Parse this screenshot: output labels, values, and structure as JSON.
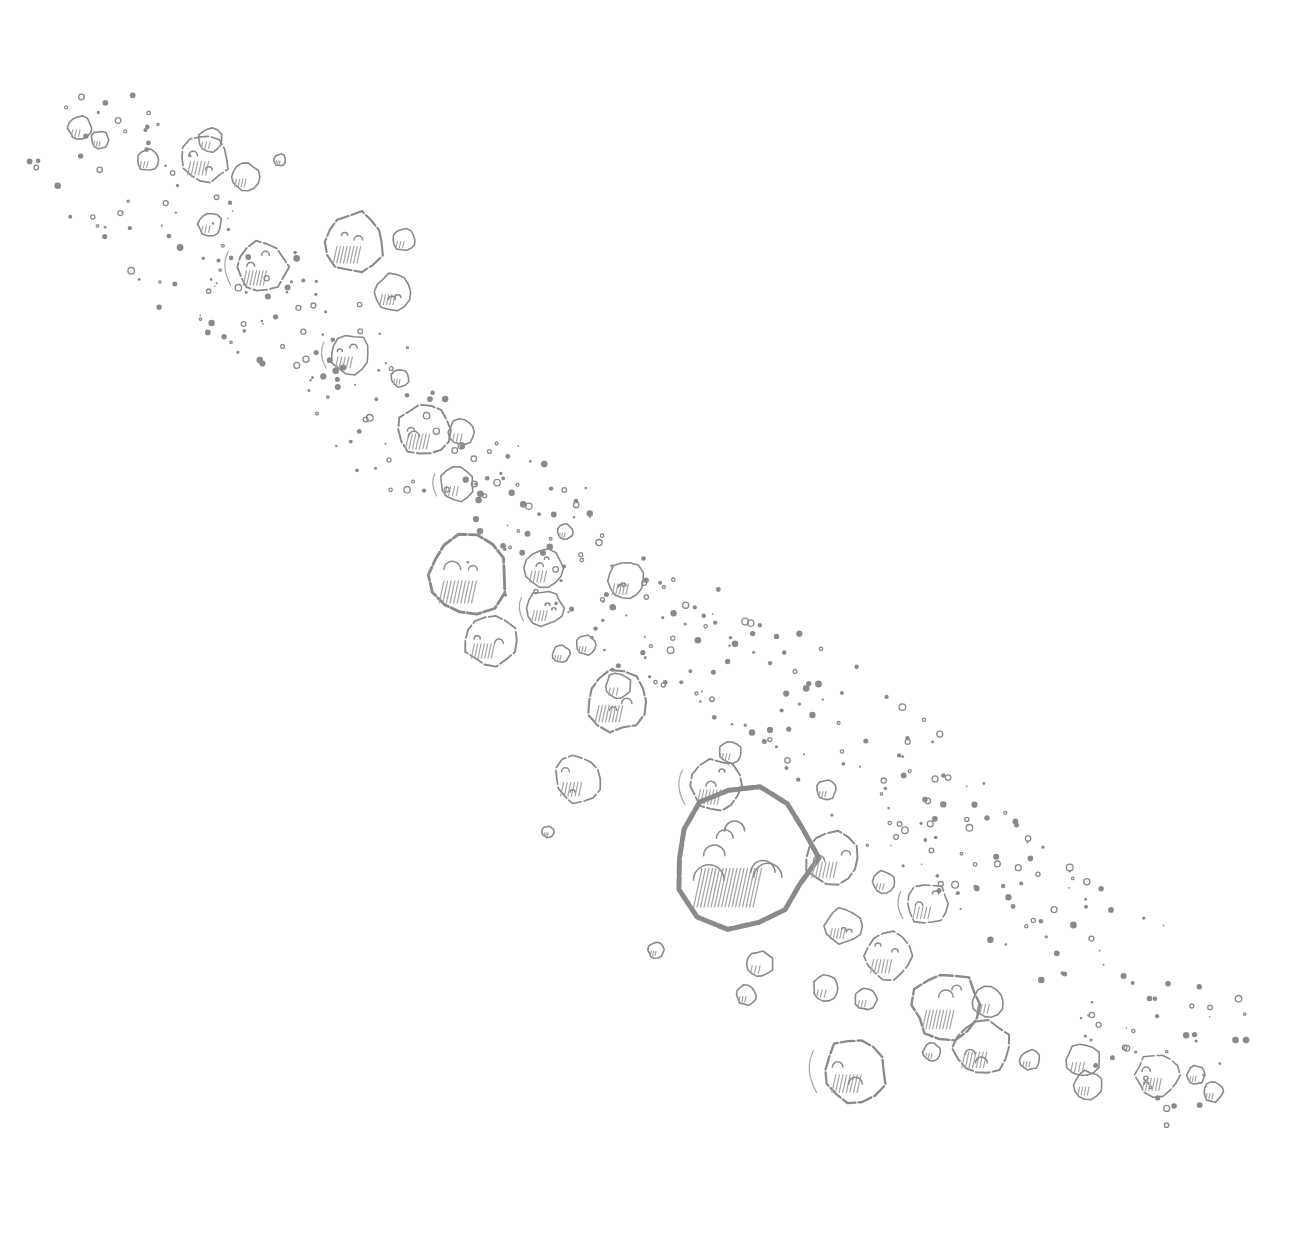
{
  "illustration": {
    "subject": "Pencil sketch of an asteroid belt",
    "background": "#ffffff",
    "ink": "#8a8a8a",
    "ink_light": "#a6a6a6",
    "width": 1298,
    "height": 1251,
    "asteroids": [
      {
        "x": 80,
        "y": 128,
        "r": 12
      },
      {
        "x": 100,
        "y": 140,
        "r": 9
      },
      {
        "x": 148,
        "y": 160,
        "r": 11
      },
      {
        "x": 205,
        "y": 158,
        "r": 24
      },
      {
        "x": 210,
        "y": 140,
        "r": 12
      },
      {
        "x": 245,
        "y": 177,
        "r": 14
      },
      {
        "x": 280,
        "y": 160,
        "r": 6
      },
      {
        "x": 210,
        "y": 224,
        "r": 12
      },
      {
        "x": 262,
        "y": 267,
        "r": 26
      },
      {
        "x": 355,
        "y": 242,
        "r": 30
      },
      {
        "x": 404,
        "y": 240,
        "r": 11
      },
      {
        "x": 393,
        "y": 292,
        "r": 18
      },
      {
        "x": 350,
        "y": 354,
        "r": 20
      },
      {
        "x": 400,
        "y": 378,
        "r": 9
      },
      {
        "x": 425,
        "y": 430,
        "r": 27
      },
      {
        "x": 462,
        "y": 432,
        "r": 13
      },
      {
        "x": 457,
        "y": 484,
        "r": 17
      },
      {
        "x": 468,
        "y": 575,
        "r": 40
      },
      {
        "x": 490,
        "y": 640,
        "r": 26
      },
      {
        "x": 544,
        "y": 568,
        "r": 20
      },
      {
        "x": 545,
        "y": 608,
        "r": 18
      },
      {
        "x": 565,
        "y": 532,
        "r": 8
      },
      {
        "x": 626,
        "y": 581,
        "r": 19
      },
      {
        "x": 586,
        "y": 645,
        "r": 10
      },
      {
        "x": 561,
        "y": 654,
        "r": 9
      },
      {
        "x": 617,
        "y": 701,
        "r": 30
      },
      {
        "x": 618,
        "y": 686,
        "r": 13
      },
      {
        "x": 578,
        "y": 779,
        "r": 24
      },
      {
        "x": 716,
        "y": 786,
        "r": 26
      },
      {
        "x": 730,
        "y": 752,
        "r": 11
      },
      {
        "x": 744,
        "y": 858,
        "r": 70
      },
      {
        "x": 832,
        "y": 858,
        "r": 28
      },
      {
        "x": 826,
        "y": 790,
        "r": 10
      },
      {
        "x": 884,
        "y": 882,
        "r": 11
      },
      {
        "x": 843,
        "y": 926,
        "r": 18
      },
      {
        "x": 888,
        "y": 956,
        "r": 24
      },
      {
        "x": 928,
        "y": 904,
        "r": 21
      },
      {
        "x": 760,
        "y": 964,
        "r": 13
      },
      {
        "x": 746,
        "y": 995,
        "r": 10
      },
      {
        "x": 826,
        "y": 988,
        "r": 13
      },
      {
        "x": 866,
        "y": 999,
        "r": 11
      },
      {
        "x": 947,
        "y": 1005,
        "r": 34
      },
      {
        "x": 988,
        "y": 1002,
        "r": 16
      },
      {
        "x": 982,
        "y": 1048,
        "r": 28
      },
      {
        "x": 855,
        "y": 1070,
        "r": 32
      },
      {
        "x": 932,
        "y": 1052,
        "r": 9
      },
      {
        "x": 1030,
        "y": 1060,
        "r": 10
      },
      {
        "x": 1083,
        "y": 1060,
        "r": 17
      },
      {
        "x": 1088,
        "y": 1085,
        "r": 14
      },
      {
        "x": 1158,
        "y": 1075,
        "r": 22
      },
      {
        "x": 1196,
        "y": 1075,
        "r": 9
      },
      {
        "x": 1213,
        "y": 1092,
        "r": 10
      },
      {
        "x": 656,
        "y": 950,
        "r": 8
      },
      {
        "x": 548,
        "y": 832,
        "r": 6
      }
    ]
  }
}
